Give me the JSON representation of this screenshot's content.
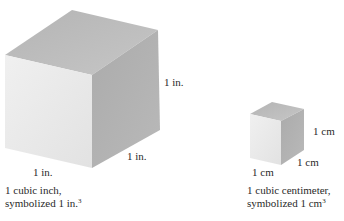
{
  "large_cube": {
    "height_label": "1 in.",
    "depth_label": "1 in.",
    "width_label": "1 in.",
    "caption_line1": "1 cubic inch,",
    "caption_line2": "symbolized 1 in.",
    "caption_exponent": "3",
    "colors": {
      "top": "#bdbdbd",
      "front": "#ebebeb",
      "side": "#a9a9a9"
    }
  },
  "small_cube": {
    "height_label": "1 cm",
    "depth_label": "1 cm",
    "width_label": "1 cm",
    "caption_line1": "1 cubic centimeter,",
    "caption_line2": "symbolized 1 cm",
    "caption_exponent": "3",
    "colors": {
      "top": "#bdbdbd",
      "front": "#ebebeb",
      "side": "#a9a9a9"
    }
  }
}
